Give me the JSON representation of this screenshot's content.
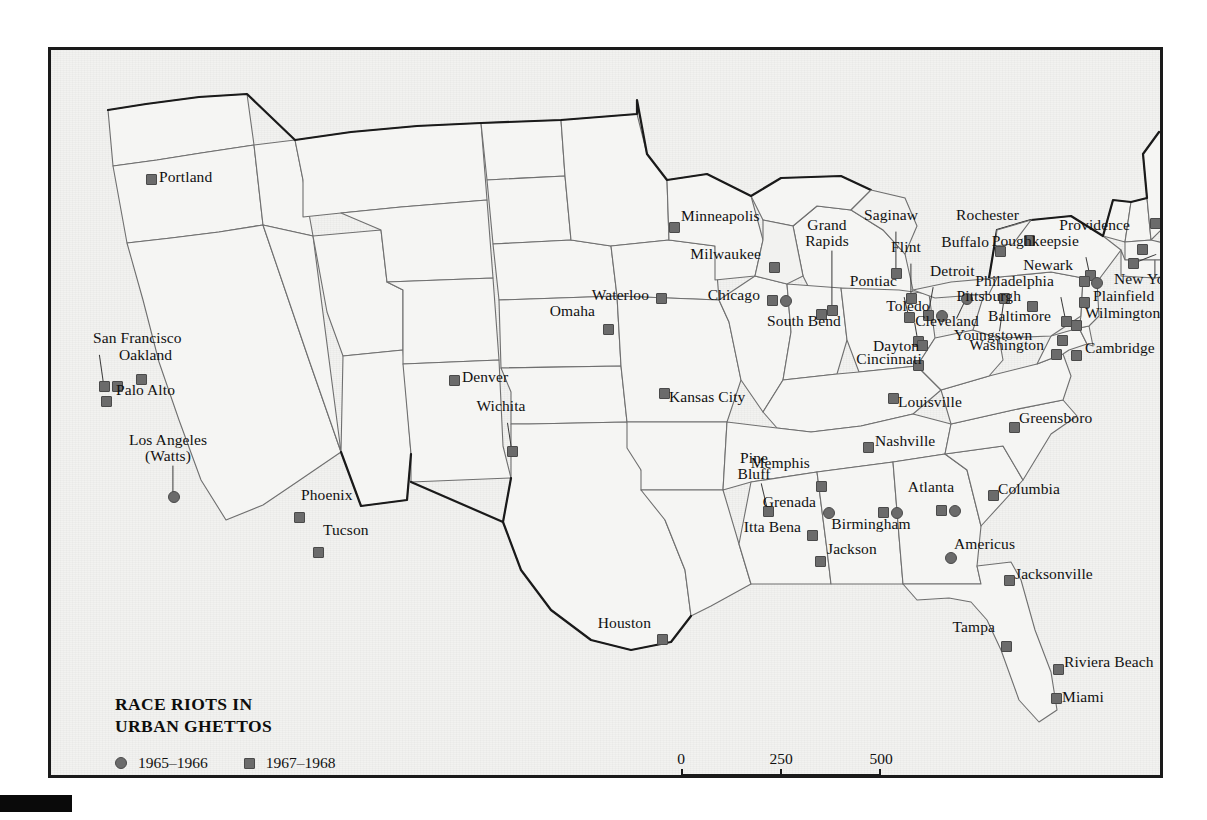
{
  "map": {
    "title": "RACE RIOTS IN\nURBAN GHETTOS",
    "legend": {
      "items": [
        {
          "symbol": "circle",
          "label": "1965–1966",
          "color": "#6b6b6b"
        },
        {
          "symbol": "square",
          "label": "1967–1968",
          "color": "#6b6b6b"
        }
      ]
    },
    "scalebar": {
      "ticks": [
        "0",
        "250",
        "500"
      ],
      "unit": "Miles"
    },
    "colors": {
      "marker": "#6b6b6b",
      "marker_edge": "#4a4a4a",
      "land": "#f2f2f0",
      "state_border": "#6f6f6f",
      "national_border": "#1a1a1a",
      "frame": "#1a1a1a",
      "text": "#111111"
    }
  },
  "chart_data": {
    "type": "map",
    "title": "RACE RIOTS IN URBAN GHETTOS",
    "subtitle": "",
    "region": "United States (contiguous 48 states)",
    "legend_position": "bottom-left",
    "series": [
      {
        "name": "1965–1966",
        "symbol": "circle",
        "color": "#6b6b6b"
      },
      {
        "name": "1967–1968",
        "symbol": "square",
        "color": "#6b6b6b"
      }
    ],
    "scale": {
      "ticks": [
        0,
        250,
        500
      ],
      "unit": "Miles"
    },
    "points": [
      {
        "label": "Portland",
        "period": "1967–1968",
        "symbols": [
          "square"
        ],
        "mx": 95,
        "my": 124,
        "lx": 108,
        "ly": 128,
        "align": "left"
      },
      {
        "label": "San Francisco",
        "period": "1967–1968",
        "symbols": [
          "square",
          "square"
        ],
        "mx": 48,
        "my": 331,
        "lx": 42,
        "ly": 289,
        "align": "left"
      },
      {
        "label": "Oakland",
        "period": "1967–1968",
        "symbols": [
          "square"
        ],
        "mx": 85,
        "my": 324,
        "lx": 68,
        "ly": 306,
        "align": "left"
      },
      {
        "label": "Palo Alto",
        "period": "1967–1968",
        "symbols": [
          "square"
        ],
        "mx": 50,
        "my": 346,
        "lx": 65,
        "ly": 341,
        "align": "left"
      },
      {
        "label": "Los Angeles\n(Watts)",
        "period": "1965–1966",
        "symbols": [
          "circle"
        ],
        "mx": 117,
        "my": 441,
        "lx": 117,
        "ly": 400,
        "align": "center"
      },
      {
        "label": "Phoenix",
        "period": "1967–1968",
        "symbols": [
          "square"
        ],
        "mx": 243,
        "my": 462,
        "lx": 250,
        "ly": 446,
        "align": "left"
      },
      {
        "label": "Tucson",
        "period": "1967–1968",
        "symbols": [
          "square"
        ],
        "mx": 262,
        "my": 497,
        "lx": 272,
        "ly": 481,
        "align": "left"
      },
      {
        "label": "Denver",
        "period": "1967–1968",
        "symbols": [
          "square"
        ],
        "mx": 398,
        "my": 325,
        "lx": 411,
        "ly": 328,
        "align": "left"
      },
      {
        "label": "Wichita",
        "period": "1967–1968",
        "symbols": [
          "square"
        ],
        "mx": 456,
        "my": 396,
        "lx": 450,
        "ly": 357,
        "align": "center"
      },
      {
        "label": "Omaha",
        "period": "1967–1968",
        "symbols": [
          "square"
        ],
        "mx": 552,
        "my": 274,
        "lx": 544,
        "ly": 262,
        "align": "right"
      },
      {
        "label": "Waterloo",
        "period": "1967–1968",
        "symbols": [
          "square"
        ],
        "mx": 605,
        "my": 243,
        "lx": 598,
        "ly": 246,
        "align": "right"
      },
      {
        "label": "Kansas City",
        "period": "1967–1968",
        "symbols": [
          "square"
        ],
        "mx": 608,
        "my": 338,
        "lx": 618,
        "ly": 348,
        "align": "left"
      },
      {
        "label": "Minneapolis",
        "period": "1967–1968",
        "symbols": [
          "square"
        ],
        "mx": 618,
        "my": 172,
        "lx": 630,
        "ly": 167,
        "align": "left"
      },
      {
        "label": "Milwaukee",
        "period": "1967–1968",
        "symbols": [
          "square"
        ],
        "mx": 718,
        "my": 212,
        "lx": 710,
        "ly": 205,
        "align": "right"
      },
      {
        "label": "Chicago",
        "period": "1965–1966",
        "symbols": [
          "square",
          "circle"
        ],
        "mx": 716,
        "my": 245,
        "lx": 709,
        "ly": 246,
        "align": "right"
      },
      {
        "label": "South Bend",
        "period": "1967–1968",
        "symbols": [
          "square"
        ],
        "mx": 765,
        "my": 259,
        "lx": 753,
        "ly": 272,
        "align": "center"
      },
      {
        "label": "Grand\nRapids",
        "period": "1967–1968",
        "symbols": [
          "square"
        ],
        "mx": 776,
        "my": 255,
        "lx": 776,
        "ly": 185,
        "align": "center"
      },
      {
        "label": "Saginaw",
        "period": "1967–1968",
        "symbols": [
          "square"
        ],
        "mx": 840,
        "my": 218,
        "lx": 840,
        "ly": 166,
        "align": "center"
      },
      {
        "label": "Flint",
        "period": "1967–1968",
        "symbols": [
          "square"
        ],
        "mx": 855,
        "my": 243,
        "lx": 855,
        "ly": 198,
        "align": "center"
      },
      {
        "label": "Pontiac",
        "period": "1967–1968",
        "symbols": [
          "square"
        ],
        "mx": 853,
        "my": 262,
        "lx": 846,
        "ly": 232,
        "align": "right"
      },
      {
        "label": "Detroit",
        "period": "1967–1968",
        "symbols": [
          "square",
          "circle"
        ],
        "mx": 872,
        "my": 260,
        "lx": 879,
        "ly": 222,
        "align": "left"
      },
      {
        "label": "Toledo",
        "period": "1967–1968",
        "symbols": [
          "square"
        ],
        "mx": 862,
        "my": 286,
        "lx": 857,
        "ly": 257,
        "align": "center"
      },
      {
        "label": "Cleveland",
        "period": "1965–1966",
        "symbols": [
          "circle"
        ],
        "mx": 910,
        "my": 243,
        "lx": 896,
        "ly": 272,
        "align": "center"
      },
      {
        "label": "Youngstown",
        "period": "1967–1968",
        "symbols": [
          "square"
        ],
        "mx": 948,
        "my": 243,
        "lx": 942,
        "ly": 286,
        "align": "center"
      },
      {
        "label": "Dayton",
        "period": "1967–1968",
        "symbols": [
          "square"
        ],
        "mx": 866,
        "my": 290,
        "lx": 845,
        "ly": 297,
        "align": "center"
      },
      {
        "label": "Cincinnati",
        "period": "1967–1968",
        "symbols": [
          "square"
        ],
        "mx": 862,
        "my": 310,
        "lx": 838,
        "ly": 310,
        "align": "center"
      },
      {
        "label": "Louisville",
        "period": "1967–1968",
        "symbols": [
          "square"
        ],
        "mx": 837,
        "my": 343,
        "lx": 847,
        "ly": 353,
        "align": "left"
      },
      {
        "label": "Buffalo",
        "period": "1967–1968",
        "symbols": [
          "square"
        ],
        "mx": 944,
        "my": 196,
        "lx": 938,
        "ly": 193,
        "align": "right"
      },
      {
        "label": "Rochester",
        "period": "1967–1968",
        "symbols": [
          "square"
        ],
        "mx": 973,
        "my": 185,
        "lx": 968,
        "ly": 166,
        "align": "right"
      },
      {
        "label": "Poughkeepsie",
        "period": "1967–1968",
        "symbols": [
          "square"
        ],
        "mx": 1034,
        "my": 220,
        "lx": 1028,
        "ly": 192,
        "align": "right"
      },
      {
        "label": "Providence",
        "period": "1967–1968",
        "symbols": [
          "square"
        ],
        "mx": 1086,
        "my": 194,
        "lx": 1079,
        "ly": 176,
        "align": "right"
      },
      {
        "label": "Boston",
        "period": "1967–1968",
        "symbols": [
          "square"
        ],
        "mx": 1099,
        "my": 168,
        "lx": 1110,
        "ly": 157,
        "align": "left"
      },
      {
        "label": "New\nHaven",
        "period": "1967–1968",
        "symbols": [
          "square"
        ],
        "mx": 1077,
        "my": 208,
        "lx": 1110,
        "ly": 195,
        "align": "left"
      },
      {
        "label": "Newark",
        "period": "1967–1968",
        "symbols": [
          "square"
        ],
        "mx": 1028,
        "my": 226,
        "lx": 1022,
        "ly": 216,
        "align": "right"
      },
      {
        "label": "New York",
        "period": "1967–1968",
        "symbols": [
          "circle"
        ],
        "mx": 1040,
        "my": 227,
        "lx": 1063,
        "ly": 230,
        "align": "left"
      },
      {
        "label": "Plainfield",
        "period": "1967–1968",
        "symbols": [
          "square"
        ],
        "mx": 1028,
        "my": 247,
        "lx": 1042,
        "ly": 247,
        "align": "left"
      },
      {
        "label": "Philadelphia",
        "period": "1967–1968",
        "symbols": [
          "square"
        ],
        "mx": 1010,
        "my": 266,
        "lx": 1003,
        "ly": 232,
        "align": "right"
      },
      {
        "label": "Pittsburgh",
        "period": "1967–1968",
        "symbols": [
          "square"
        ],
        "mx": 976,
        "my": 251,
        "lx": 970,
        "ly": 247,
        "align": "right"
      },
      {
        "label": "Wilmington",
        "period": "1967–1968",
        "symbols": [
          "square"
        ],
        "mx": 1020,
        "my": 270,
        "lx": 1034,
        "ly": 264,
        "align": "left"
      },
      {
        "label": "Baltimore",
        "period": "1967–1968",
        "symbols": [
          "square"
        ],
        "mx": 1006,
        "my": 285,
        "lx": 1000,
        "ly": 267,
        "align": "right"
      },
      {
        "label": "Washington",
        "period": "1967–1968",
        "symbols": [
          "square"
        ],
        "mx": 1000,
        "my": 299,
        "lx": 993,
        "ly": 296,
        "align": "right"
      },
      {
        "label": "Cambridge",
        "period": "1967–1968",
        "symbols": [
          "square"
        ],
        "mx": 1020,
        "my": 300,
        "lx": 1034,
        "ly": 299,
        "align": "left"
      },
      {
        "label": "Greensboro",
        "period": "1967–1968",
        "symbols": [
          "square"
        ],
        "mx": 958,
        "my": 372,
        "lx": 968,
        "ly": 369,
        "align": "left"
      },
      {
        "label": "Nashville",
        "period": "1967–1968",
        "symbols": [
          "square"
        ],
        "mx": 812,
        "my": 392,
        "lx": 824,
        "ly": 392,
        "align": "left"
      },
      {
        "label": "Memphis",
        "period": "1967–1968",
        "symbols": [
          "square"
        ],
        "mx": 765,
        "my": 431,
        "lx": 759,
        "ly": 414,
        "align": "right"
      },
      {
        "label": "Pine\nBluff",
        "period": "1967–1968",
        "symbols": [
          "square"
        ],
        "mx": 712,
        "my": 456,
        "lx": 703,
        "ly": 418,
        "align": "center"
      },
      {
        "label": "Itta Bena",
        "period": "1967–1968",
        "symbols": [
          "square"
        ],
        "mx": 756,
        "my": 480,
        "lx": 750,
        "ly": 478,
        "align": "right"
      },
      {
        "label": "Grenada",
        "period": "1965–1966",
        "symbols": [
          "circle"
        ],
        "mx": 772,
        "my": 457,
        "lx": 765,
        "ly": 453,
        "align": "right"
      },
      {
        "label": "Jackson",
        "period": "1967–1968",
        "symbols": [
          "square"
        ],
        "mx": 764,
        "my": 506,
        "lx": 776,
        "ly": 500,
        "align": "left"
      },
      {
        "label": "Birmingham",
        "period": "1965–1966",
        "symbols": [
          "square",
          "circle"
        ],
        "mx": 827,
        "my": 457,
        "lx": 820,
        "ly": 475,
        "align": "center"
      },
      {
        "label": "Atlanta",
        "period": "1965–1966",
        "symbols": [
          "square",
          "circle"
        ],
        "mx": 885,
        "my": 455,
        "lx": 880,
        "ly": 438,
        "align": "center"
      },
      {
        "label": "Americus",
        "period": "1965–1966",
        "symbols": [
          "circle"
        ],
        "mx": 894,
        "my": 502,
        "lx": 903,
        "ly": 495,
        "align": "left"
      },
      {
        "label": "Columbia",
        "period": "1967–1968",
        "symbols": [
          "square"
        ],
        "mx": 937,
        "my": 440,
        "lx": 947,
        "ly": 440,
        "align": "left"
      },
      {
        "label": "Jacksonville",
        "period": "1967–1968",
        "symbols": [
          "square"
        ],
        "mx": 953,
        "my": 525,
        "lx": 964,
        "ly": 525,
        "align": "left"
      },
      {
        "label": "Tampa",
        "period": "1967–1968",
        "symbols": [
          "square"
        ],
        "mx": 950,
        "my": 591,
        "lx": 944,
        "ly": 578,
        "align": "right"
      },
      {
        "label": "Riviera Beach",
        "period": "1967–1968",
        "symbols": [
          "square"
        ],
        "mx": 1002,
        "my": 614,
        "lx": 1013,
        "ly": 613,
        "align": "left"
      },
      {
        "label": "Miami",
        "period": "1967–1968",
        "symbols": [
          "square"
        ],
        "mx": 1000,
        "my": 643,
        "lx": 1011,
        "ly": 648,
        "align": "left"
      },
      {
        "label": "Houston",
        "period": "1967–1968",
        "symbols": [
          "square"
        ],
        "mx": 606,
        "my": 584,
        "lx": 600,
        "ly": 574,
        "align": "right"
      }
    ]
  }
}
